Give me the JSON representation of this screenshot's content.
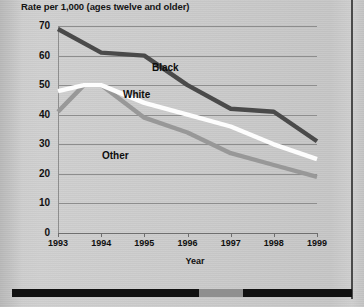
{
  "chart_data": {
    "type": "line",
    "title": "Rate per 1,000 (ages twelve and older)",
    "xlabel": "Year",
    "ylabel": "",
    "categories": [
      "1993",
      "1994",
      "1995",
      "1996",
      "1997",
      "1998",
      "1999"
    ],
    "x": [
      1993,
      1994,
      1995,
      1996,
      1997,
      1998,
      1999
    ],
    "xlim": [
      1993,
      1999
    ],
    "ylim": [
      0,
      70
    ],
    "yticks": [
      "0",
      "10",
      "20",
      "30",
      "40",
      "50",
      "60",
      "70"
    ],
    "ytick_values": [
      0,
      10,
      20,
      30,
      40,
      50,
      60,
      70
    ],
    "grid": true,
    "legend": "inline-annotations",
    "series": [
      {
        "name": "Black",
        "color": "#4a4a4a",
        "values": [
          69,
          61,
          60,
          50,
          42,
          41,
          31
        ],
        "label_position": {
          "x": 152,
          "y": 62
        }
      },
      {
        "name": "White",
        "color": "#fdfdfd",
        "values": [
          48,
          50,
          44,
          40,
          36,
          30,
          25
        ],
        "peak": {
          "x": 1993.6,
          "y": 50
        },
        "label_position": {
          "x": 123,
          "y": 89
        }
      },
      {
        "name": "Other",
        "color": "#989898",
        "values": [
          41,
          50,
          39,
          34,
          27,
          23,
          19
        ],
        "peak": {
          "x": 1993.6,
          "y": 50
        },
        "label_position": {
          "x": 102,
          "y": 150
        }
      }
    ]
  },
  "decor": {
    "bottom_bar_segments": [
      {
        "color": "#111111",
        "flex": 55
      },
      {
        "color": "#8f8f8f",
        "flex": 13
      },
      {
        "color": "#111111",
        "flex": 32
      }
    ],
    "right_rule_color": "#4a4a4a"
  }
}
